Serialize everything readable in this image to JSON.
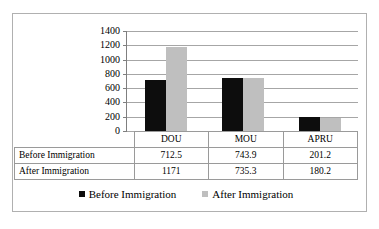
{
  "chart_data": {
    "type": "bar",
    "title": "",
    "xlabel": "",
    "ylabel": "",
    "categories": [
      "DOU",
      "MOU",
      "APRU"
    ],
    "series": [
      {
        "name": "Before Immigration",
        "color": "#0D0D0D",
        "values": [
          712.5,
          743.9,
          201.2
        ]
      },
      {
        "name": "After Immigration",
        "color": "#BFBFBF",
        "values": [
          1171,
          735.3,
          180.2
        ]
      }
    ],
    "ylim": [
      0,
      1400
    ],
    "yticks": [
      0,
      200,
      400,
      600,
      800,
      1000,
      1200,
      1400
    ],
    "ytick_labels": [
      "0",
      "200",
      "400",
      "600",
      "800",
      "1000",
      "1200",
      "1400"
    ],
    "grid": true,
    "legend_position": "bottom"
  },
  "axis": {
    "ticks": [
      {
        "label": "1400",
        "value": 1400
      },
      {
        "label": "1200",
        "value": 1200
      },
      {
        "label": "1000",
        "value": 1000
      },
      {
        "label": "800",
        "value": 800
      },
      {
        "label": "600",
        "value": 600
      },
      {
        "label": "400",
        "value": 400
      },
      {
        "label": "200",
        "value": 200
      },
      {
        "label": "0",
        "value": 0
      }
    ]
  },
  "table": {
    "header": [
      "",
      "DOU",
      "MOU",
      "APRU"
    ],
    "rows": [
      {
        "label": "Before Immigration",
        "cells": [
          "712.5",
          "743.9",
          "201.2"
        ]
      },
      {
        "label": "After Immigration",
        "cells": [
          "1171",
          "735.3",
          "180.2"
        ]
      }
    ]
  },
  "legend": {
    "items": [
      {
        "label": "Before Immigration",
        "color": "#0D0D0D"
      },
      {
        "label": "After Immigration",
        "color": "#BFBFBF"
      }
    ]
  }
}
